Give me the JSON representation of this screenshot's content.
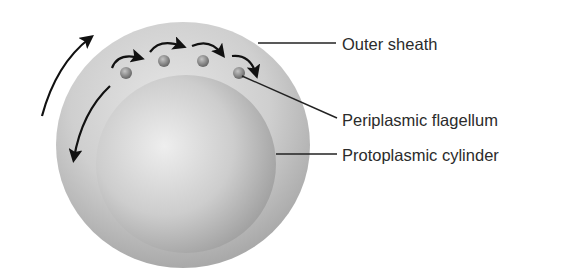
{
  "figure": {
    "labels": [
      {
        "id": "outer-sheath",
        "text": "Outer sheath"
      },
      {
        "id": "periplasmic-flagellum",
        "text": "Periplasmic flagellum"
      },
      {
        "id": "protoplasmic-cylinder",
        "text": "Protoplasmic cylinder"
      }
    ],
    "colors": {
      "outer_sheath": "#bdbdbd",
      "protoplasmic_cylinder": "#c8c8c8",
      "flagellum": "#8a8a8a",
      "arrows": "#111111",
      "leader_lines": "#222222"
    },
    "flagella_count": 4,
    "rotation_arrows": [
      "clockwise-outer-left-up",
      "counterclockwise-inner-left-down",
      "flagellum-rotation x4"
    ]
  }
}
